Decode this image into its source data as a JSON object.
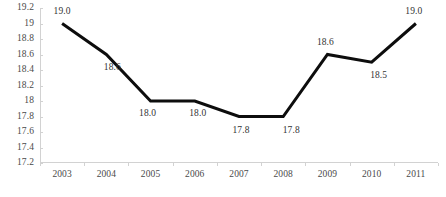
{
  "chart_data": {
    "type": "line",
    "title": "",
    "subtitle": "",
    "xlabel": "",
    "ylabel": "",
    "categories": [
      "2003",
      "2004",
      "2005",
      "2006",
      "2007",
      "2008",
      "2009",
      "2010",
      "2011"
    ],
    "values": [
      19.0,
      18.6,
      18.0,
      18.0,
      17.8,
      17.8,
      18.6,
      18.5,
      19.0
    ],
    "data_labels": [
      "19.0",
      "18.6",
      "18.0",
      "18.0",
      "17.8",
      "17.8",
      "18.6",
      "18.5",
      "19.0"
    ],
    "ylim": [
      17.2,
      19.2
    ],
    "ytick_values": [
      19.2,
      19.0,
      18.8,
      18.6,
      18.4,
      18.2,
      18.0,
      17.8,
      17.6,
      17.4,
      17.2
    ],
    "ytick_labels": [
      "19.2",
      "19",
      "18.8",
      "18.6",
      "18.4",
      "18.2",
      "18",
      "17.8",
      "17.6",
      "17.4",
      "17.2"
    ],
    "grid": false,
    "legend": false,
    "legend_position": "none",
    "series_color": "#0d0d0d",
    "axis_color": "#d2d2d2",
    "text_color": "#4a4a4a",
    "label_color": "#333333",
    "background_color": "#ffffff",
    "line_width": 3,
    "markers": false,
    "label_offsets": [
      {
        "dx": 0,
        "dy": -12
      },
      {
        "dx": 6,
        "dy": 13
      },
      {
        "dx": -3,
        "dy": 13
      },
      {
        "dx": 3,
        "dy": 13
      },
      {
        "dx": 2,
        "dy": 14
      },
      {
        "dx": 8,
        "dy": 14
      },
      {
        "dx": -2,
        "dy": -12
      },
      {
        "dx": 7,
        "dy": 14
      },
      {
        "dx": -2,
        "dy": -12
      }
    ]
  }
}
